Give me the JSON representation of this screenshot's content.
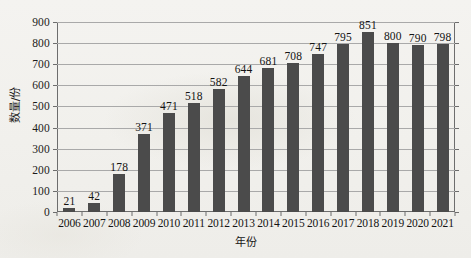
{
  "chart_data": {
    "type": "bar",
    "title": "",
    "subtitle": "",
    "xlabel": "年份",
    "ylabel": "数量/份",
    "categories": [
      "2006",
      "2007",
      "2008",
      "2009",
      "2010",
      "2011",
      "2012",
      "2013",
      "2014",
      "2015",
      "2016",
      "2017",
      "2018",
      "2019",
      "2020",
      "2021"
    ],
    "values": [
      21,
      42,
      178,
      371,
      471,
      518,
      582,
      644,
      681,
      708,
      747,
      795,
      851,
      800,
      790,
      798
    ],
    "ylim": [
      0,
      900
    ],
    "ytick_labels": [
      "0",
      "100",
      "200",
      "300",
      "400",
      "500",
      "600",
      "700",
      "800",
      "900"
    ],
    "ytick_values": [
      0,
      100,
      200,
      300,
      400,
      500,
      600,
      700,
      800,
      900
    ],
    "grid": true,
    "legend": "none",
    "bar_color": "#4b4b4b",
    "grid_color": "#a9a9a9",
    "axis_color": "#6d6d6d",
    "background_color": "#f2f1ee",
    "data_labels_shown": true
  }
}
